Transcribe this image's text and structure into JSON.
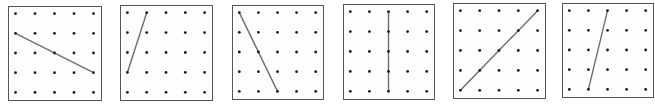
{
  "colors": {
    "border": "#555555",
    "dot": "#1a1a1a",
    "segment": "#6e6e6e",
    "background": "#ffffff"
  },
  "grid": {
    "columns": 5,
    "rows": 5
  },
  "boards": [
    {
      "id": 1,
      "box": {
        "left": 8,
        "top": 6,
        "right": 102,
        "bottom": 101
      },
      "segment": {
        "from": [
          0,
          1
        ],
        "to": [
          4,
          3
        ]
      }
    },
    {
      "id": 2,
      "box": {
        "left": 120,
        "top": 5,
        "right": 213,
        "bottom": 101
      },
      "segment": {
        "from": [
          1,
          0
        ],
        "to": [
          0,
          3
        ]
      }
    },
    {
      "id": 3,
      "box": {
        "left": 232,
        "top": 5,
        "right": 324,
        "bottom": 100
      },
      "segment": {
        "from": [
          0,
          0
        ],
        "to": [
          2,
          4
        ]
      }
    },
    {
      "id": 4,
      "box": {
        "left": 343,
        "top": 4,
        "right": 435,
        "bottom": 100
      },
      "segment": {
        "from": [
          2,
          0
        ],
        "to": [
          2,
          4
        ]
      }
    },
    {
      "id": 5,
      "box": {
        "left": 453,
        "top": 3,
        "right": 546,
        "bottom": 99
      },
      "segment": {
        "from": [
          4,
          0
        ],
        "to": [
          0,
          4
        ]
      }
    },
    {
      "id": 6,
      "box": {
        "left": 562,
        "top": 3,
        "right": 654,
        "bottom": 98
      },
      "segment": {
        "from": [
          2,
          0
        ],
        "to": [
          1,
          4
        ]
      }
    }
  ]
}
